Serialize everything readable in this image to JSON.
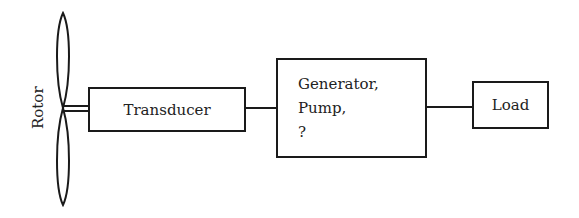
{
  "diagram": {
    "type": "block-diagram",
    "rotor": {
      "label": "Rotor"
    },
    "blocks": [
      {
        "id": "transducer",
        "label": "Transducer"
      },
      {
        "id": "generator",
        "lines": [
          "Generator,",
          "Pump,",
          "?"
        ]
      },
      {
        "id": "load",
        "label": "Load"
      }
    ],
    "connections": [
      {
        "from": "rotor",
        "to": "transducer",
        "style": "double-line shaft"
      },
      {
        "from": "transducer",
        "to": "generator"
      },
      {
        "from": "generator",
        "to": "load"
      }
    ],
    "colors": {
      "stroke": "#1a1a1a",
      "background": "#ffffff"
    }
  }
}
